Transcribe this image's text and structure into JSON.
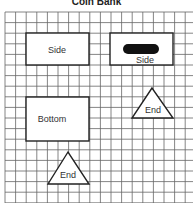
{
  "title": "Coin Bank",
  "shapes": {
    "side_left": "Side",
    "side_right": "Side",
    "bottom": "Bottom",
    "end_right": "End",
    "end_bottom": "End"
  },
  "colors": {
    "grid": "#555555",
    "outline": "#222222",
    "slot": "#111111"
  }
}
